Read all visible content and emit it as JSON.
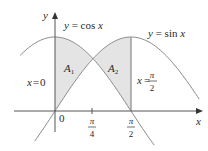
{
  "diagram": {
    "axes": {
      "x_label": "x",
      "y_label": "y",
      "origin_label": "0"
    },
    "curves": [
      {
        "name": "cos",
        "label": "y = cos x",
        "label_prefix": "y = cos ",
        "label_var": "x"
      },
      {
        "name": "sin",
        "label": "y = sin x",
        "label_prefix": "y = sin ",
        "label_var": "x"
      }
    ],
    "ticks": [
      {
        "value": "pi/4",
        "numerator": "π",
        "denominator": "4"
      },
      {
        "value": "pi/2",
        "numerator": "π",
        "denominator": "2"
      }
    ],
    "boundaries": [
      {
        "label": "x = 0",
        "lhs": "x",
        "eq": "=",
        "rhs": "0"
      },
      {
        "label": "x = π/2",
        "lhs": "x",
        "eq": "=",
        "numerator": "π",
        "denominator": "2"
      }
    ],
    "regions": [
      {
        "name": "A1",
        "letter": "A",
        "subscript": "1",
        "interval": "[0, pi/4]",
        "upper": "cos x",
        "lower": "sin x"
      },
      {
        "name": "A2",
        "letter": "A",
        "subscript": "2",
        "interval": "[pi/4, pi/2]",
        "upper": "sin x",
        "lower": "cos x"
      }
    ],
    "colors": {
      "curve": "#8a8a8a",
      "axis": "#555555",
      "shade": "#e4e4e4",
      "text": "#2a2a2a"
    }
  }
}
